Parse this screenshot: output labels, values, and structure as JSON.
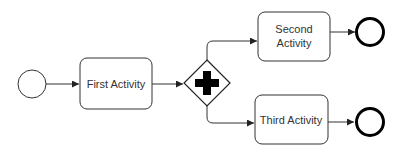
{
  "diagram": {
    "type": "BPMN process",
    "colors": {
      "stroke": "#222222",
      "text": "#333333",
      "background": "#ffffff",
      "gateway_marker": "#000000"
    },
    "start_event": {
      "label": ""
    },
    "activities": [
      {
        "id": "first",
        "label": "First Activity",
        "lines": [
          "First Activity"
        ]
      },
      {
        "id": "second",
        "label": "Second Activity",
        "lines": [
          "Second",
          "Activity"
        ]
      },
      {
        "id": "third",
        "label": "Third Activity",
        "lines": [
          "Third Activity"
        ]
      }
    ],
    "gateway": {
      "kind": "parallel",
      "icon": "plus-icon"
    },
    "end_events": [
      {
        "id": "end-top",
        "label": ""
      },
      {
        "id": "end-bottom",
        "label": ""
      }
    ],
    "flows": [
      {
        "from": "start",
        "to": "first"
      },
      {
        "from": "first",
        "to": "gateway"
      },
      {
        "from": "gateway",
        "to": "second"
      },
      {
        "from": "gateway",
        "to": "third"
      },
      {
        "from": "second",
        "to": "end-top"
      },
      {
        "from": "third",
        "to": "end-bottom"
      }
    ]
  }
}
